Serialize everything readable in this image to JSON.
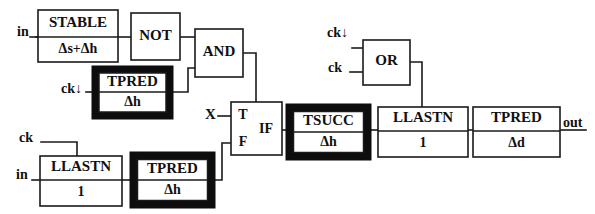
{
  "diagram": {
    "ink_color": "#101010",
    "background": "#ffffff",
    "io_labels": {
      "in_top": "in",
      "in_bottom": "in",
      "ck_down_left": "ck↓",
      "ck_left": "ck",
      "ck_down_right": "ck↓",
      "ck_right": "ck",
      "x": "X",
      "out": "out"
    },
    "blocks": [
      {
        "id": "stable",
        "name": "STABLE",
        "delay": "Δs+Δh",
        "bold": false
      },
      {
        "id": "not",
        "name": "NOT",
        "delay": "",
        "bold": false
      },
      {
        "id": "and",
        "name": "AND",
        "delay": "",
        "bold": false
      },
      {
        "id": "tpred-left",
        "name": "TPRED",
        "delay": "Δh",
        "bold": true
      },
      {
        "id": "llastn-left",
        "name": "LLASTN",
        "delay": "1",
        "bold": false
      },
      {
        "id": "tpred-bottom",
        "name": "TPRED",
        "delay": "Δh",
        "bold": true
      },
      {
        "id": "if",
        "name": "IF",
        "delay": "",
        "bold": false
      },
      {
        "id": "or",
        "name": "OR",
        "delay": "",
        "bold": false
      },
      {
        "id": "tsucc",
        "name": "TSUCC",
        "delay": "Δh",
        "bold": true
      },
      {
        "id": "llastn-right",
        "name": "LLASTN",
        "delay": "1",
        "bold": false
      },
      {
        "id": "tpred-right",
        "name": "TPRED",
        "delay": "Δd",
        "bold": false
      }
    ],
    "if_ports": {
      "true": "T",
      "false": "F",
      "label": "IF"
    }
  }
}
